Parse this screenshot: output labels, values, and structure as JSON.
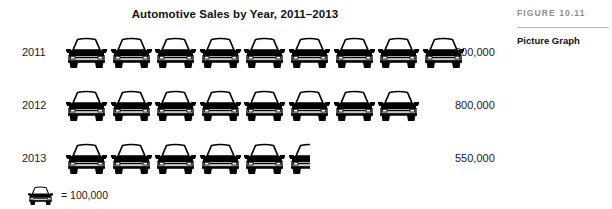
{
  "chart_data": {
    "type": "bar",
    "title": "Automotive Sales by Year, 2011–2013",
    "xlabel": "",
    "ylabel": "",
    "categories": [
      "2011",
      "2012",
      "2013"
    ],
    "values": [
      900000,
      800000,
      550000
    ],
    "value_labels": [
      "900,000",
      "800,000",
      "550,000"
    ],
    "icons_per_category": [
      9,
      8,
      5.5
    ],
    "icon_unit_value": 100000,
    "icon_unit_label": "100,000",
    "icon_name": "car-icon",
    "legend_equals": "=",
    "legend_position": "below-plot-left",
    "grid": false
  },
  "chart": {
    "title": "Automotive Sales by Year, 2011–2013",
    "rows": [
      {
        "label": "2011",
        "value_label": "900,000",
        "icons": 9,
        "full_icons": 9,
        "half_icon": false
      },
      {
        "label": "2012",
        "value_label": "800,000",
        "icons": 8,
        "full_icons": 8,
        "half_icon": false
      },
      {
        "label": "2013",
        "value_label": "550,000",
        "icons": 5.5,
        "full_icons": 5,
        "half_icon": true
      }
    ],
    "legend": {
      "equals": "=",
      "unit_label": "100,000",
      "text": "=  100,000"
    }
  },
  "sidebar": {
    "figure_number": "FIGURE 10.11",
    "caption": "Picture Graph"
  },
  "colors": {
    "ink": "#1a1a1a",
    "icon_fill": "#000000",
    "icon_body": "#c9c9c9",
    "figure_number": "#8d8d8d",
    "rule": "#b9b9b9",
    "background": "#ffffff"
  }
}
